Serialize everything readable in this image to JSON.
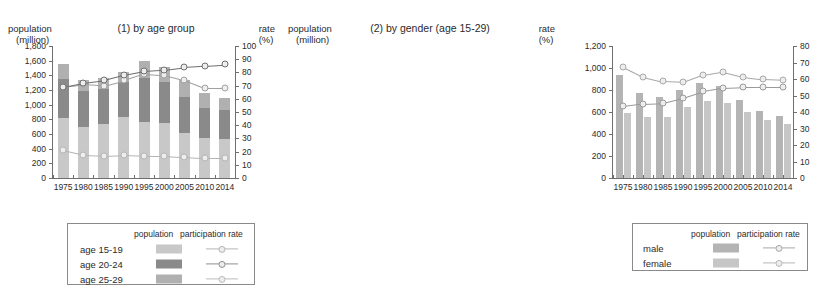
{
  "chart_data": [
    {
      "type": "bar",
      "id": "by-age-group",
      "title": "(1) by age group",
      "ylabel": "population",
      "ylabel_unit": "(million)",
      "y2label": "rate",
      "y2label_unit": "(%)",
      "xlabel": "",
      "categories": [
        "1975",
        "1980",
        "1985",
        "1990",
        "1995",
        "2000",
        "2005",
        "2010",
        "2014"
      ],
      "ylim": [
        0,
        1800
      ],
      "yticks": [
        0,
        200,
        400,
        600,
        800,
        1000,
        1200,
        1400,
        1600,
        1800
      ],
      "ytick_labels": [
        "0",
        "200",
        "400",
        "600",
        "800",
        "1,000",
        "1,200",
        "1,400",
        "1,600",
        "1,800"
      ],
      "y2lim": [
        0,
        100
      ],
      "y2ticks": [
        0,
        10,
        20,
        30,
        40,
        50,
        60,
        70,
        80,
        90,
        100
      ],
      "y2tick_labels": [
        "0",
        "10",
        "20",
        "30",
        "40",
        "50",
        "60",
        "70",
        "80",
        "90",
        "100"
      ],
      "grid": false,
      "stacked": true,
      "series": [
        {
          "name": "age 15-19",
          "kind": "bar",
          "color": "#c8c8c8",
          "values": [
            820,
            700,
            730,
            830,
            760,
            750,
            615,
            545,
            530
          ]
        },
        {
          "name": "age 20-24",
          "kind": "bar",
          "color": "#8a8a8a",
          "values": [
            530,
            480,
            480,
            480,
            600,
            560,
            490,
            415,
            400
          ]
        },
        {
          "name": "age 25-29",
          "kind": "bar",
          "color": "#b0b0b0",
          "values": [
            210,
            150,
            150,
            140,
            230,
            210,
            225,
            205,
            160
          ]
        },
        {
          "name": "age 15-19 participation rate",
          "kind": "line",
          "color": "#b5b5b5",
          "values": [
            21,
            17.5,
            17,
            17.5,
            17,
            17,
            16,
            15,
            15
          ]
        },
        {
          "name": "age 20-24 participation rate",
          "kind": "line",
          "color": "#a0a0a0",
          "values": [
            69,
            71,
            70,
            74,
            79,
            78,
            74,
            68,
            68
          ]
        },
        {
          "name": "age 25-29 participation rate",
          "kind": "line",
          "color": "#6f6f6f",
          "values": [
            69,
            72,
            74,
            78,
            81,
            82,
            84,
            85,
            86
          ]
        }
      ]
    },
    {
      "type": "bar",
      "id": "by-gender",
      "title": "(2) by gender (age 15-29)",
      "ylabel": "population",
      "ylabel_unit": "(million)",
      "y2label": "rate",
      "y2label_unit": "(%)",
      "xlabel": "",
      "categories": [
        "1975",
        "1980",
        "1985",
        "1990",
        "1995",
        "2000",
        "2005",
        "2010",
        "2014"
      ],
      "ylim": [
        0,
        1200
      ],
      "yticks": [
        0,
        200,
        400,
        600,
        800,
        1000,
        1200
      ],
      "ytick_labels": [
        "0",
        "200",
        "400",
        "600",
        "800",
        "1,000",
        "1,200"
      ],
      "y2lim": [
        0,
        80
      ],
      "y2ticks": [
        0,
        10,
        20,
        30,
        40,
        50,
        60,
        70,
        80
      ],
      "y2tick_labels": [
        "0",
        "10",
        "20",
        "30",
        "40",
        "50",
        "60",
        "70",
        "80"
      ],
      "grid": false,
      "stacked": false,
      "series": [
        {
          "name": "male",
          "kind": "bar",
          "color": "#b4b4b4",
          "values": [
            940,
            775,
            740,
            800,
            865,
            840,
            710,
            610,
            565
          ]
        },
        {
          "name": "female",
          "kind": "bar",
          "color": "#c6c6c6",
          "values": [
            595,
            552,
            558,
            642,
            698,
            682,
            602,
            528,
            495
          ]
        },
        {
          "name": "male participation rate",
          "kind": "line",
          "color": "#a8a8a8",
          "values": [
            67.5,
            61.5,
            58.5,
            58,
            62.5,
            64.5,
            61.5,
            60,
            59.5
          ]
        },
        {
          "name": "female participation rate",
          "kind": "line",
          "color": "#9a9a9a",
          "values": [
            43.5,
            45,
            45.5,
            48.5,
            52.5,
            54.5,
            55,
            55,
            55
          ]
        }
      ]
    }
  ],
  "panels": [
    {
      "title": "(1) by age group",
      "left_axis_title": "population",
      "left_axis_unit": "(million)",
      "right_axis_title": "rate",
      "right_axis_unit": "(%)",
      "legend": {
        "header_population": "population",
        "header_rate": "participation rate",
        "rows": [
          {
            "label": "age 15-19",
            "swatch": "#c8c8c8",
            "line": "#b5b5b5"
          },
          {
            "label": "age 20-24",
            "swatch": "#8a8a8a",
            "line": "#8f8f8f"
          },
          {
            "label": "age 25-29",
            "swatch": "#b0b0b0",
            "line": "#bdbdbd"
          }
        ]
      }
    },
    {
      "title": "(2) by gender (age 15-29)",
      "left_axis_title": "population",
      "left_axis_unit": "(million)",
      "right_axis_title": "rate",
      "right_axis_unit": "(%)",
      "legend": {
        "header_population": "population",
        "header_rate": "participation rate",
        "rows": [
          {
            "label": "male",
            "swatch": "#b4b4b4",
            "line": "#a8a8a8"
          },
          {
            "label": "female",
            "swatch": "#c6c6c6",
            "line": "#b8b8b8"
          }
        ]
      }
    }
  ],
  "colors": {
    "axis": "#6f6f6f",
    "text": "#2b2b2b",
    "legend_border": "#8a8a8a",
    "background": "#ffffff"
  }
}
